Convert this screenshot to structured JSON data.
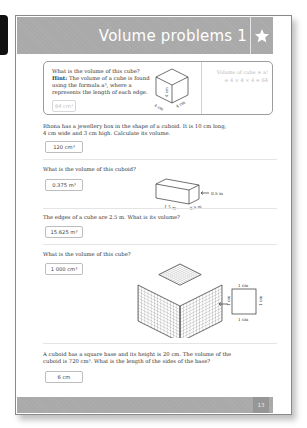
{
  "page": {
    "title": "Volume problems 1",
    "page_number": "13",
    "header_color": "#a9a9a9",
    "icon": "star-icon"
  },
  "example": {
    "question": "What is the volume of this cube?",
    "hint_label": "Hint:",
    "hint_text": "The volume of a cube is found using the formula a³, where a represents the length of each edge.",
    "answer": "64 cm³",
    "working_line1": "Volume of cube = a³",
    "working_line2": "= 4 × 4 × 4 = 64",
    "cube_labels": [
      "4 cm",
      "4 cm",
      "4 cm"
    ]
  },
  "questions": [
    {
      "text_line1": "Rhona has a jewellery box in the shape of a cuboid. It is 10 cm long,",
      "text_line2": "4 cm wide and 3 cm high. Calculate its volume.",
      "answer": "120 cm³"
    },
    {
      "text_line1": "What is the volume of this cuboid?",
      "answer": "0.375 m³",
      "diagram_labels": [
        "1.5 m",
        "0.5 m",
        "0.5 m"
      ]
    },
    {
      "text_line1": "The edges of a cube are 2.5 m. What is its volume?",
      "answer": "15.625 m³"
    },
    {
      "text_line1": "What is the volume of this cube?",
      "answer": "1 000 cm³",
      "diagram_labels": [
        "1 cm",
        "1 cm",
        "1 cm",
        "1 cm"
      ]
    },
    {
      "text_line1": "A cuboid has a square base and its height is 20 cm. The volume of the",
      "text_line2": "cuboid is 720 cm³. What is the length of the sides of the base?",
      "answer": "6 cm"
    }
  ]
}
